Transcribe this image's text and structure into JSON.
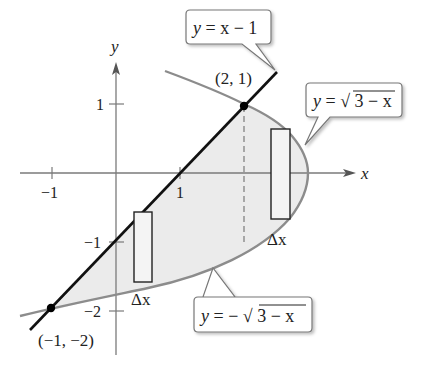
{
  "figure": {
    "axes": {
      "x_label": "x",
      "y_label": "y",
      "x_ticks": [
        {
          "value": -1,
          "label": "−1"
        },
        {
          "value": 1,
          "label": "1"
        }
      ],
      "y_ticks": [
        {
          "value": 1,
          "label": "1"
        },
        {
          "value": -1,
          "label": "−1"
        },
        {
          "value": -2,
          "label": "−2"
        }
      ]
    },
    "curves": {
      "line": {
        "equation": "y = x − 1",
        "label_y": "y",
        "label_eq": "= x − 1"
      },
      "upper": {
        "equation": "y = √(3 − x)",
        "label_y": "y",
        "label_eq": "= ",
        "radical": "√",
        "radicand": "3 − x"
      },
      "lower": {
        "equation": "y = −√(3 − x)",
        "label_y": "y",
        "label_eq": "= −",
        "radical": "√",
        "radicand": "3 − x"
      }
    },
    "points": [
      {
        "label": "(2, 1)",
        "x": 2,
        "y": 1
      },
      {
        "label": "(−1, −2)",
        "x": -1,
        "y": -2
      }
    ],
    "rectangles": [
      {
        "label": "Δx",
        "position": "left"
      },
      {
        "label": "Δx",
        "position": "right"
      }
    ],
    "colors": {
      "line": "#111111",
      "parabola": "#8c8c8c",
      "fill": "#ebebeb",
      "axis": "#7a7a7a"
    }
  }
}
